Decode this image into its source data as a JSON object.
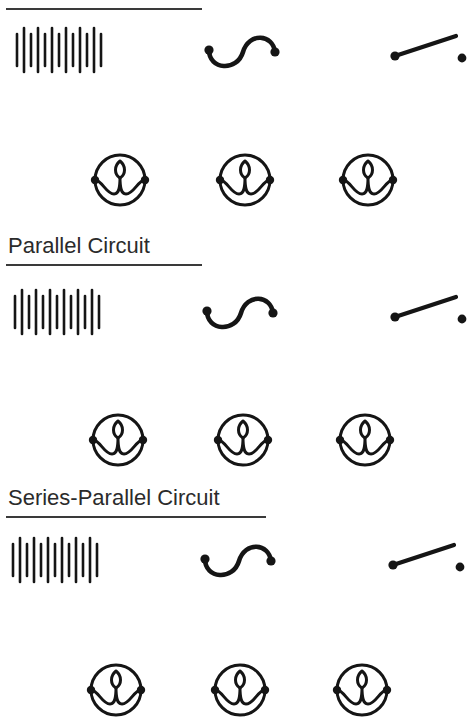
{
  "page": {
    "background_color": "#ffffff",
    "ink_color": "#151515",
    "heading_color": "#2b2b2b",
    "width": 471,
    "height": 706
  },
  "sections": [
    {
      "id": "section-1",
      "heading": "",
      "heading_visible": false,
      "heading_note": "heading text cropped off top of image; only underline rule visible",
      "underline": {
        "x": 6,
        "y": 8,
        "width": 196
      },
      "rows": [
        {
          "id": "row-1-symbols",
          "y": 50,
          "items": [
            {
              "name": "battery-cells-symbol",
              "label": "Battery (multi-cell)",
              "cx": 60,
              "cy": 50,
              "bars": 13
            },
            {
              "name": "wire-scurve-symbol",
              "label": "Curved wire / conductor",
              "cx": 242,
              "cy": 52
            },
            {
              "name": "open-switch-symbol",
              "label": "Open switch",
              "cx": 424,
              "cy": 48
            }
          ]
        },
        {
          "id": "row-1-lamps",
          "y": 180,
          "items": [
            {
              "name": "lamp-symbol",
              "label": "Lamp",
              "cx": 120,
              "cy": 180
            },
            {
              "name": "lamp-symbol",
              "label": "Lamp",
              "cx": 245,
              "cy": 180
            },
            {
              "name": "lamp-symbol",
              "label": "Lamp",
              "cx": 368,
              "cy": 180
            }
          ]
        }
      ]
    },
    {
      "id": "section-2",
      "heading": "Parallel Circuit",
      "heading_visible": true,
      "heading_pos": {
        "x": 8,
        "y": 236
      },
      "underline": {
        "x": 6,
        "y": 264,
        "width": 196
      },
      "rows": [
        {
          "id": "row-2-symbols",
          "y": 312,
          "items": [
            {
              "name": "battery-cells-symbol",
              "label": "Battery (multi-cell)",
              "cx": 58,
              "cy": 312,
              "bars": 13
            },
            {
              "name": "wire-scurve-symbol",
              "label": "Curved wire / conductor",
              "cx": 240,
              "cy": 313
            },
            {
              "name": "open-switch-symbol",
              "label": "Open switch",
              "cx": 424,
              "cy": 309
            }
          ]
        },
        {
          "id": "row-2-lamps",
          "y": 440,
          "items": [
            {
              "name": "lamp-symbol",
              "label": "Lamp",
              "cx": 118,
              "cy": 440
            },
            {
              "name": "lamp-symbol",
              "label": "Lamp",
              "cx": 243,
              "cy": 440
            },
            {
              "name": "lamp-symbol",
              "label": "Lamp",
              "cx": 365,
              "cy": 440
            }
          ]
        }
      ]
    },
    {
      "id": "section-3",
      "heading": "Series-Parallel Circuit",
      "heading_visible": true,
      "heading_pos": {
        "x": 8,
        "y": 488
      },
      "underline": {
        "x": 6,
        "y": 516,
        "width": 260
      },
      "rows": [
        {
          "id": "row-3-symbols",
          "y": 560,
          "items": [
            {
              "name": "battery-cells-symbol",
              "label": "Battery (multi-cell)",
              "cx": 56,
              "cy": 560,
              "bars": 13
            },
            {
              "name": "wire-scurve-symbol",
              "label": "Curved wire / conductor",
              "cx": 238,
              "cy": 561
            },
            {
              "name": "open-switch-symbol",
              "label": "Open switch",
              "cx": 422,
              "cy": 557
            }
          ]
        },
        {
          "id": "row-3-lamps",
          "y": 690,
          "cropped": true,
          "items": [
            {
              "name": "lamp-symbol",
              "label": "Lamp",
              "cx": 116,
              "cy": 690
            },
            {
              "name": "lamp-symbol",
              "label": "Lamp",
              "cx": 240,
              "cy": 690
            },
            {
              "name": "lamp-symbol",
              "label": "Lamp",
              "cx": 362,
              "cy": 690
            }
          ]
        }
      ]
    }
  ]
}
